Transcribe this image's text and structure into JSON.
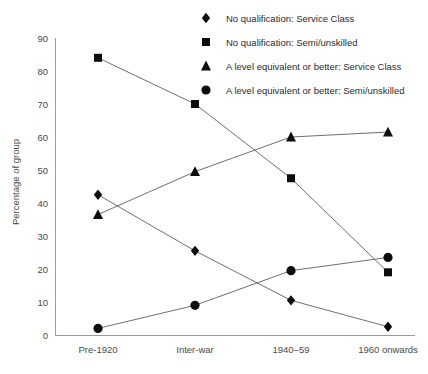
{
  "chart_data": {
    "type": "line",
    "title": "",
    "xlabel": "",
    "ylabel": "Percentage of group",
    "categories": [
      "Pre-1920",
      "Inter-war",
      "1940–59",
      "1960 onwards"
    ],
    "yticks": [
      0,
      10,
      20,
      30,
      40,
      50,
      60,
      70,
      80,
      90
    ],
    "ylim": [
      0,
      90
    ],
    "grid": false,
    "legend_position": "top-right",
    "series": [
      {
        "name": "No qualification: Service Class",
        "marker": "diamond",
        "values": [
          42.5,
          25.5,
          10.5,
          2.5
        ]
      },
      {
        "name": "No qualification: Semi/unskilled",
        "marker": "square",
        "values": [
          84,
          70,
          47.5,
          19
        ]
      },
      {
        "name": "A level equivalent or better: Service Class",
        "marker": "triangle",
        "values": [
          36.5,
          49.5,
          60,
          61.5
        ]
      },
      {
        "name": "A level equivalent or better: Semi/unskilled",
        "marker": "circle",
        "values": [
          2,
          9,
          19.5,
          23.5
        ]
      }
    ]
  },
  "colors": {
    "marker": "#0d0d0d",
    "line": "#6f6f6f",
    "axis": "#9a9a9a",
    "text": "#3a3a3a",
    "background": "#ffffff"
  }
}
